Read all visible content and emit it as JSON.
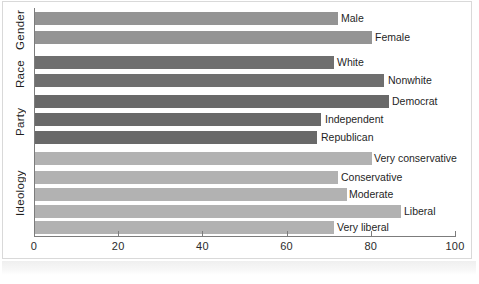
{
  "figure": {
    "background_color": "#ffffff",
    "axis_color": "#7c7c7c"
  },
  "chart_data": {
    "type": "bar",
    "orientation": "horizontal",
    "title": "",
    "subtitle": "",
    "xlabel": "",
    "ylabel": "",
    "xlim": [
      0,
      100
    ],
    "xticks": [
      0,
      20,
      40,
      60,
      80,
      100
    ],
    "xtick_labels": [
      "0",
      "20",
      "40",
      "60",
      "80",
      "100"
    ],
    "grid": false,
    "legend": "none",
    "groups": [
      {
        "name": "Gender",
        "color": "#949494",
        "categories": [
          "Male",
          "Female"
        ],
        "values": [
          72,
          80
        ]
      },
      {
        "name": "Race",
        "color": "#6f6f6f",
        "categories": [
          "White",
          "Nonwhite"
        ],
        "values": [
          71,
          83
        ]
      },
      {
        "name": "Party",
        "color": "#696969",
        "categories": [
          "Democrat",
          "Independent",
          "Republican"
        ],
        "values": [
          84,
          68,
          67
        ]
      },
      {
        "name": "Ideology",
        "color": "#b2b2b2",
        "categories": [
          "Very conservative",
          "Conservative",
          "Moderate",
          "Liberal",
          "Very liberal"
        ],
        "values": [
          80,
          72,
          74,
          87,
          71
        ]
      }
    ],
    "categories": [
      "Male",
      "Female",
      "White",
      "Nonwhite",
      "Democrat",
      "Independent",
      "Republican",
      "Very conservative",
      "Conservative",
      "Moderate",
      "Liberal",
      "Very liberal"
    ],
    "values": [
      72,
      80,
      71,
      83,
      84,
      68,
      67,
      80,
      72,
      74,
      87,
      71
    ]
  },
  "bars": [
    {
      "label": "Male",
      "value": 72,
      "group": "gender",
      "top": 12,
      "label_x": 341
    },
    {
      "label": "Female",
      "value": 80,
      "group": "gender",
      "top": 31,
      "label_x": 375
    },
    {
      "label": "White",
      "value": 71,
      "group": "race",
      "top": 56,
      "label_x": 337
    },
    {
      "label": "Nonwhite",
      "value": 83,
      "group": "race",
      "top": 74,
      "label_x": 388
    },
    {
      "label": "Democrat",
      "value": 84,
      "group": "party",
      "top": 95,
      "label_x": 392
    },
    {
      "label": "Independent",
      "value": 68,
      "group": "party",
      "top": 113,
      "label_x": 325
    },
    {
      "label": "Republican",
      "value": 67,
      "group": "party",
      "top": 131,
      "label_x": 321
    },
    {
      "label": "Very conservative",
      "value": 80,
      "group": "ideology",
      "top": 152,
      "label_x": 374
    },
    {
      "label": "Conservative",
      "value": 72,
      "group": "ideology",
      "top": 171,
      "label_x": 341
    },
    {
      "label": "Moderate",
      "value": 74,
      "group": "ideology",
      "top": 188,
      "label_x": 349
    },
    {
      "label": "Liberal",
      "value": 87,
      "group": "ideology",
      "top": 205,
      "label_x": 404
    },
    {
      "label": "Very liberal",
      "value": 71,
      "group": "ideology",
      "top": 221,
      "label_x": 337
    }
  ],
  "group_labels": [
    {
      "name": "Gender",
      "top": 8,
      "height": 44
    },
    {
      "name": "Race",
      "top": 54,
      "height": 40
    },
    {
      "name": "Party",
      "top": 94,
      "height": 56
    },
    {
      "name": "Ideology",
      "top": 150,
      "height": 86
    }
  ],
  "axis": {
    "ticks": [
      {
        "label": "0",
        "value": 0
      },
      {
        "label": "20",
        "value": 20
      },
      {
        "label": "40",
        "value": 40
      },
      {
        "label": "60",
        "value": 60
      },
      {
        "label": "80",
        "value": 80
      },
      {
        "label": "100",
        "value": 100
      }
    ]
  }
}
